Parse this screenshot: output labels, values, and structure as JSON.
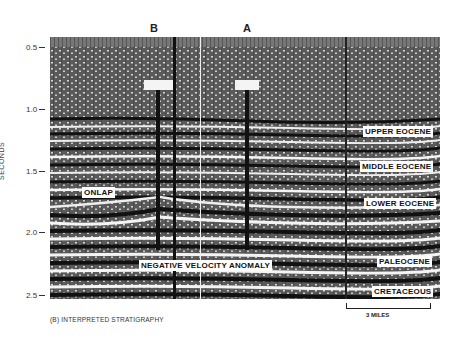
{
  "figure": {
    "caption": "(B)   INTERPRETED STRATIGRAPHY",
    "y_axis": {
      "label": "SECONDS",
      "ticks": [
        {
          "label": "0.5",
          "y": 44
        },
        {
          "label": "1.0",
          "y": 106
        },
        {
          "label": "1.5",
          "y": 168
        },
        {
          "label": "2.0",
          "y": 229
        },
        {
          "label": "2.5",
          "y": 292
        }
      ]
    },
    "wells": [
      {
        "label": "B",
        "x": 150
      },
      {
        "label": "A",
        "x": 243
      }
    ],
    "annotations": {
      "upper_eocene": "UPPER EOCENE",
      "middle_eocene": "MIDDLE EOCENE",
      "lower_eocene": "LOWER EOCENE",
      "paleocene": "PALEOCENE",
      "cretaceous": "CRETACEOUS",
      "onlap": "ONLAP",
      "negative_velocity_anomaly": "NEGATIVE VELOCITY ANOMALY"
    },
    "scale_bar": {
      "label": "3 MILES"
    }
  }
}
